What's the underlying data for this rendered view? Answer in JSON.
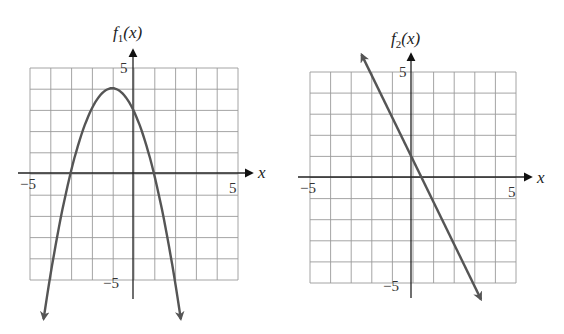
{
  "chart_data": [
    {
      "type": "line",
      "title": "f1(x)",
      "function": "f1(x) = -(x+1)^2 + 4",
      "ylabel": "f1(x)",
      "xlabel": "x",
      "xlim": [
        -5,
        5
      ],
      "ylim": [
        -5,
        5
      ],
      "grid": true,
      "tick_labels": {
        "x_min": "−5",
        "x_max": "5",
        "y_max": "5",
        "y_min": "−5"
      },
      "key_points": [
        {
          "x": -3,
          "y": 0,
          "label": "x-intercept"
        },
        {
          "x": 1,
          "y": 0,
          "label": "x-intercept"
        },
        {
          "x": -1,
          "y": 4,
          "label": "vertex (maximum)"
        },
        {
          "x": 0,
          "y": 3,
          "label": "y-intercept"
        }
      ],
      "x": [
        -4.3,
        -4,
        -3,
        -2,
        -1,
        0,
        1,
        2,
        2.3
      ],
      "values": [
        -6.89,
        -5,
        0,
        3,
        4,
        3,
        0,
        -5,
        -6.89
      ]
    },
    {
      "type": "line",
      "title": "f2(x)",
      "function": "f2(x) = -2x + 1",
      "ylabel": "f2(x)",
      "xlabel": "x",
      "xlim": [
        -5,
        5
      ],
      "ylim": [
        -5,
        5
      ],
      "grid": true,
      "tick_labels": {
        "x_min": "−5",
        "x_max": "5",
        "y_max": "5",
        "y_min": "−5"
      },
      "key_points": [
        {
          "x": 0,
          "y": 1,
          "label": "y-intercept"
        },
        {
          "x": 0.5,
          "y": 0,
          "label": "x-intercept"
        }
      ],
      "x": [
        -2.4,
        -2,
        0,
        0.5,
        3,
        3.4
      ],
      "values": [
        5.8,
        5,
        1,
        0,
        -5,
        -5.8
      ]
    }
  ],
  "graphs": [
    {
      "func_name": "f",
      "func_sub": "1",
      "func_arg": "(x)",
      "x_axis_label": "x",
      "tick_x_min": "−5",
      "tick_x_max": "5",
      "tick_y_max": "5",
      "tick_y_min": "−5"
    },
    {
      "func_name": "f",
      "func_sub": "2",
      "func_arg": "(x)",
      "x_axis_label": "x",
      "tick_x_min": "−5",
      "tick_x_max": "5",
      "tick_y_max": "5",
      "tick_y_min": "−5"
    }
  ]
}
